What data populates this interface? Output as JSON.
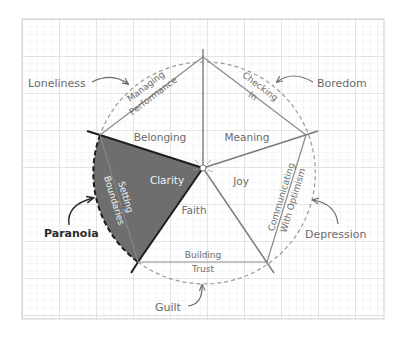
{
  "diagram": {
    "type": "pentagon-wheel",
    "center": {
      "x": 203,
      "y": 168
    },
    "radius": 111,
    "colors": {
      "grid_minor": "#e6e6e6",
      "grid_major": "#d2d2d2",
      "grid_border": "#cfcfcf",
      "spoke": "#7a7a7a",
      "edge": "#8a8a8a",
      "circle": "#9a9a9a",
      "highlight_fill": "#6e6e6e",
      "highlight_stroke": "#1e1e1e",
      "text": "#6b6b6b",
      "text_dark": "#2a2a2a",
      "text_inverse": "#f2f2f2"
    },
    "edges": [
      {
        "id": "managing-performance",
        "line1": "Managing",
        "line2": "Performance"
      },
      {
        "id": "checking-in",
        "line1": "Checking",
        "line2": "In"
      },
      {
        "id": "communicating-with-optimism",
        "line1": "Communicating",
        "line2": "With Optimism"
      },
      {
        "id": "building-trust",
        "line1": "Building",
        "line2": "Trust"
      },
      {
        "id": "setting-boundaries",
        "line1": "Setting",
        "line2": "Boundaries",
        "highlighted": true
      }
    ],
    "sectors": [
      {
        "id": "belonging",
        "label": "Belonging"
      },
      {
        "id": "meaning",
        "label": "Meaning"
      },
      {
        "id": "joy",
        "label": "Joy"
      },
      {
        "id": "faith",
        "label": "Faith"
      },
      {
        "id": "clarity",
        "label": "Clarity",
        "highlighted": true
      }
    ],
    "outer_states": [
      {
        "id": "loneliness",
        "label": "Loneliness"
      },
      {
        "id": "boredom",
        "label": "Boredom"
      },
      {
        "id": "depression",
        "label": "Depression"
      },
      {
        "id": "guilt",
        "label": "Guilt"
      },
      {
        "id": "paranoia",
        "label": "Paranoia",
        "highlighted": true
      }
    ]
  }
}
